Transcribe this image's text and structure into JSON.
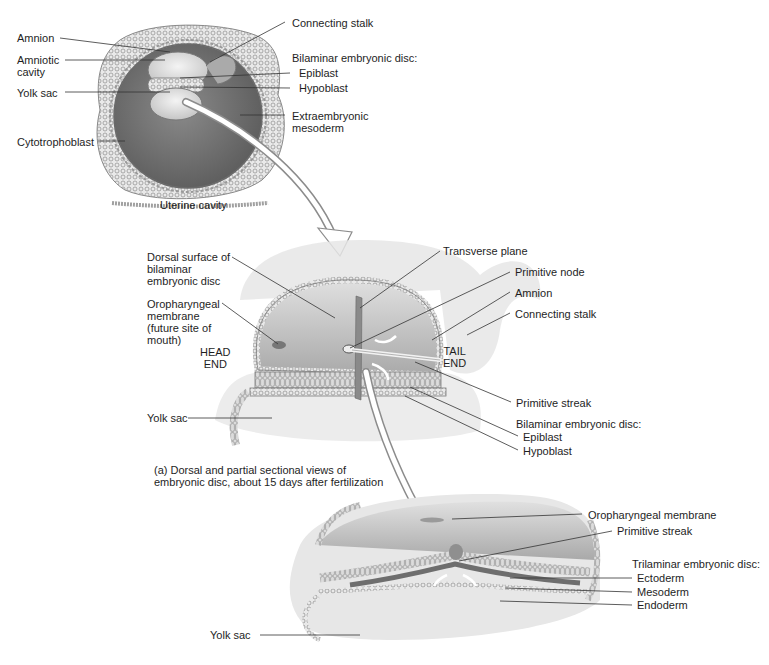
{
  "panel_top": {
    "labels": {
      "amnion": "Amnion",
      "amniotic_cavity": "Amniotic\ncavity",
      "yolk_sac": "Yolk sac",
      "cytotrophoblast": "Cytotrophoblast",
      "connecting_stalk": "Connecting stalk",
      "bilaminar_heading": "Bilaminar embryonic disc:",
      "epiblast": "Epiblast",
      "hypoblast": "Hypoblast",
      "extraembryonic_mesoderm": "Extraembryonic\nmesoderm",
      "uterine_cavity": "Uterine cavity"
    }
  },
  "panel_middle": {
    "labels": {
      "dorsal_surface": "Dorsal surface of\nbilaminar\nembryonic disc",
      "oropharyngeal_membrane": "Oropharyngeal\nmembrane\n(future site of\nmouth)",
      "head_end": "HEAD\nEND",
      "tail_end": "TAIL\nEND",
      "yolk_sac": "Yolk sac",
      "transverse_plane": "Transverse plane",
      "primitive_node": "Primitive node",
      "amnion": "Amnion",
      "connecting_stalk": "Connecting stalk",
      "primitive_streak": "Primitive streak",
      "bilaminar_heading": "Bilaminar embryonic disc:",
      "epiblast": "Epiblast",
      "hypoblast": "Hypoblast"
    },
    "caption": "(a) Dorsal and partial sectional views of\n     embryonic disc, about 15 days after fertilization"
  },
  "panel_bottom": {
    "labels": {
      "oropharyngeal_membrane": "Oropharyngeal membrane",
      "primitive_streak": "Primitive streak",
      "trilaminar_heading": "Trilaminar embryonic disc:",
      "ectoderm": "Ectoderm",
      "mesoderm": "Mesoderm",
      "endoderm": "Endoderm",
      "yolk_sac": "Yolk sac"
    }
  },
  "colors": {
    "tissue_dark": "#6e6e6e",
    "tissue_mid": "#9a9a9a",
    "tissue_light": "#d6d6d6",
    "leader_line": "#333333",
    "background": "#ffffff"
  }
}
